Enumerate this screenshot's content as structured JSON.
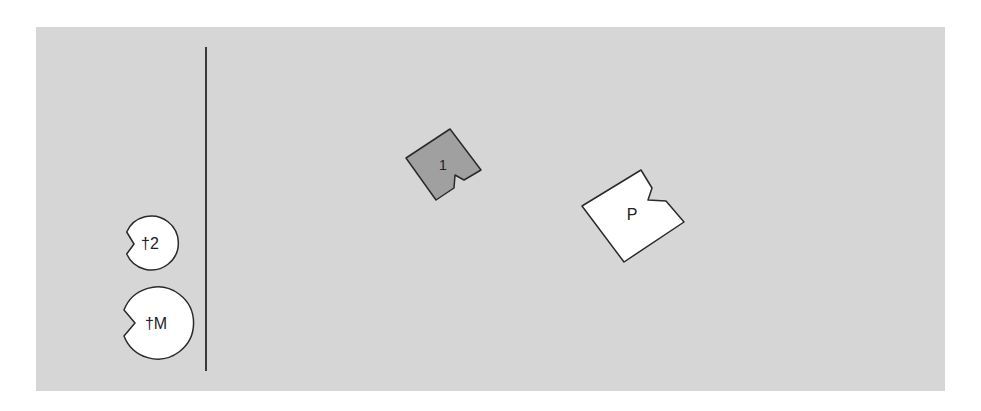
{
  "diagram": {
    "background_color": "#d6d6d6",
    "divider_color": "#3a3a3a",
    "pieces": [
      {
        "id": "piece-1",
        "label": "1",
        "fill": "#a0a0a0",
        "shape": "notched-square"
      },
      {
        "id": "piece-p",
        "label": "P",
        "fill": "#ffffff",
        "shape": "notched-square"
      }
    ],
    "markers": [
      {
        "id": "marker-2",
        "label": "†2",
        "fill": "#ffffff",
        "shape": "notched-circle"
      },
      {
        "id": "marker-m",
        "label": "†M",
        "fill": "#ffffff",
        "shape": "notched-circle"
      }
    ]
  }
}
